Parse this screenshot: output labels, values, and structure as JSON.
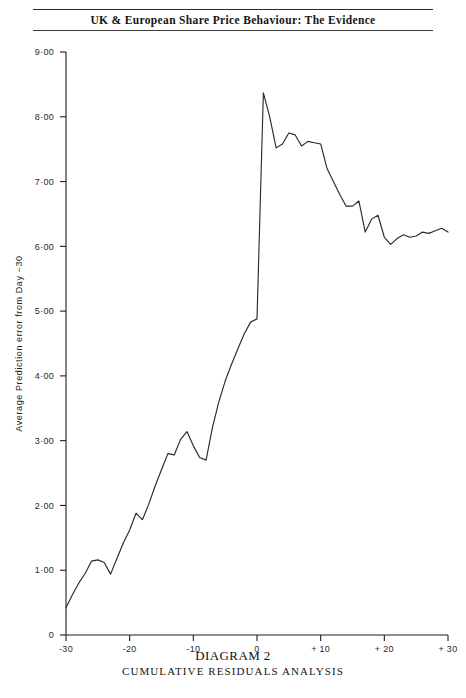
{
  "header": {
    "title": "UK & European Share Price Behaviour: The Evidence"
  },
  "caption": {
    "main": "DIAGRAM 2",
    "sub": "CUMULATIVE RESIDUALS ANALYSIS"
  },
  "chart_data": {
    "type": "line",
    "title": "Cumulative Residuals Analysis",
    "subtitle": "DIAGRAM 2",
    "xlabel": "Day  relative  to  Announcement  Date",
    "ylabel": "Average  Prediction  error  from  Day  −30",
    "xlim": [
      -30,
      30
    ],
    "ylim": [
      0,
      9
    ],
    "grid": false,
    "legend": null,
    "line_color": "#2a2a2a",
    "xticks": [
      -30,
      -20,
      -10,
      0,
      10,
      20,
      30
    ],
    "xtick_labels": [
      "-30",
      "-20",
      "-10",
      "0",
      "+ 10",
      "+ 20",
      "+ 30"
    ],
    "yticks": [
      0,
      1,
      2,
      3,
      4,
      5,
      6,
      7,
      8,
      9
    ],
    "ytick_labels": [
      "0",
      "1·00",
      "2·00",
      "3·00",
      "4·00",
      "5·00",
      "6·00",
      "7·00",
      "8·00",
      "9·00"
    ],
    "x": [
      -30,
      -29,
      -28,
      -27,
      -26,
      -25,
      -24,
      -23,
      -22,
      -21,
      -20,
      -19,
      -18,
      -17,
      -16,
      -15,
      -14,
      -13,
      -12,
      -11,
      -10,
      -9,
      -8,
      -7,
      -6,
      -5,
      -4,
      -3,
      -2,
      -1,
      0,
      1,
      2,
      3,
      4,
      5,
      6,
      7,
      8,
      9,
      10,
      11,
      12,
      13,
      14,
      15,
      16,
      17,
      18,
      19,
      20,
      21,
      22,
      23,
      24,
      25,
      26,
      27,
      28,
      29,
      30
    ],
    "values": [
      0.42,
      0.62,
      0.8,
      0.95,
      1.14,
      1.16,
      1.12,
      0.94,
      1.18,
      1.42,
      1.62,
      1.88,
      1.78,
      2.02,
      2.3,
      2.55,
      2.8,
      2.78,
      3.02,
      3.14,
      2.92,
      2.74,
      2.7,
      3.2,
      3.6,
      3.92,
      4.18,
      4.42,
      4.65,
      4.83,
      4.88,
      8.37,
      8.0,
      7.52,
      7.58,
      7.75,
      7.72,
      7.55,
      7.62,
      7.6,
      7.58,
      7.2,
      7.0,
      6.8,
      6.62,
      6.62,
      6.7,
      6.22,
      6.42,
      6.48,
      6.14,
      6.03,
      6.12,
      6.18,
      6.14,
      6.16,
      6.22,
      6.2,
      6.24,
      6.28,
      6.22
    ],
    "peak": {
      "day": 1,
      "value": 8.37
    },
    "pre_event_level": {
      "day": 0,
      "value": 4.88
    },
    "start": {
      "day": -30,
      "value": 0.42
    },
    "end": {
      "day": 30,
      "value": 6.22
    }
  }
}
